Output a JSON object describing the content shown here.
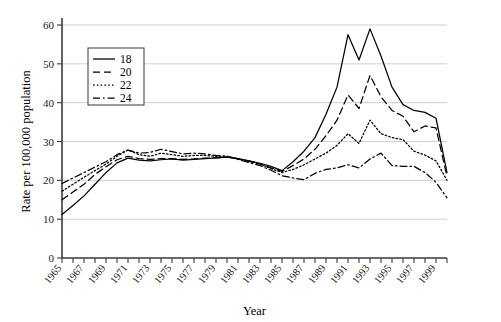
{
  "chart_data": {
    "type": "line",
    "title": "",
    "xlabel": "Year",
    "ylabel": "Rate per 100,000 population",
    "xlim": [
      1965,
      2000
    ],
    "ylim": [
      0,
      60
    ],
    "yticks": [
      0,
      10,
      20,
      30,
      40,
      50,
      60
    ],
    "grid": "horizontal",
    "legend_position": "upper-left-inside",
    "x": [
      1965,
      1966,
      1967,
      1968,
      1969,
      1970,
      1971,
      1972,
      1973,
      1974,
      1975,
      1976,
      1977,
      1978,
      1979,
      1980,
      1981,
      1982,
      1983,
      1984,
      1985,
      1986,
      1987,
      1988,
      1989,
      1990,
      1991,
      1992,
      1993,
      1994,
      1995,
      1996,
      1997,
      1998,
      1999,
      2000
    ],
    "xtick_labels": [
      "1965",
      "1967",
      "1969",
      "1971",
      "1973",
      "1975",
      "1977",
      "1979",
      "1981",
      "1983",
      "1985",
      "1987",
      "1989",
      "1991",
      "1993",
      "1995",
      "1997",
      "1999"
    ],
    "xtick_values": [
      1965,
      1967,
      1969,
      1971,
      1973,
      1975,
      1977,
      1979,
      1981,
      1983,
      1985,
      1987,
      1989,
      1991,
      1993,
      1995,
      1997,
      1999
    ],
    "series": [
      {
        "name": "18",
        "style": "solid",
        "values": [
          11.2,
          13.5,
          16.0,
          19.0,
          22.0,
          24.5,
          25.7,
          25.2,
          25.0,
          25.3,
          25.5,
          25.2,
          25.4,
          25.6,
          25.8,
          26.0,
          25.6,
          25.0,
          24.4,
          23.6,
          22.5,
          24.8,
          27.5,
          31.0,
          37.0,
          44.0,
          57.5,
          51.0,
          59.0,
          52.0,
          44.0,
          39.5,
          38.0,
          37.5,
          36.0,
          22.0
        ]
      },
      {
        "name": "20",
        "style": "dashed",
        "values": [
          15.0,
          17.0,
          19.0,
          21.5,
          23.5,
          25.3,
          26.2,
          25.6,
          25.4,
          25.6,
          25.6,
          25.4,
          25.5,
          25.7,
          25.8,
          26.0,
          25.5,
          24.9,
          24.2,
          23.2,
          22.3,
          23.8,
          25.5,
          28.0,
          31.5,
          35.5,
          42.0,
          38.5,
          47.0,
          41.5,
          38.0,
          36.5,
          32.5,
          34.0,
          33.5,
          21.0
        ]
      },
      {
        "name": "22",
        "style": "dotted",
        "values": [
          17.2,
          19.0,
          20.8,
          22.5,
          24.2,
          26.2,
          27.8,
          26.6,
          26.2,
          27.0,
          26.6,
          26.2,
          26.4,
          26.4,
          26.2,
          26.2,
          25.6,
          25.0,
          24.2,
          23.0,
          22.0,
          22.8,
          24.0,
          25.5,
          27.0,
          29.0,
          32.0,
          29.5,
          35.5,
          32.0,
          31.0,
          30.5,
          27.5,
          26.5,
          25.0,
          20.0
        ]
      },
      {
        "name": "24",
        "style": "dashdot",
        "values": [
          19.2,
          20.6,
          22.0,
          23.4,
          24.8,
          26.6,
          27.8,
          27.0,
          27.2,
          28.0,
          27.4,
          26.8,
          27.0,
          26.8,
          26.4,
          26.2,
          25.4,
          24.6,
          23.8,
          22.6,
          21.2,
          20.6,
          20.2,
          21.8,
          22.8,
          23.2,
          24.0,
          23.2,
          25.5,
          27.0,
          23.8,
          23.6,
          23.6,
          22.0,
          19.5,
          15.5
        ]
      }
    ]
  },
  "legend": {
    "entries": [
      {
        "label": "18"
      },
      {
        "label": "20"
      },
      {
        "label": "22"
      },
      {
        "label": "24"
      }
    ]
  }
}
